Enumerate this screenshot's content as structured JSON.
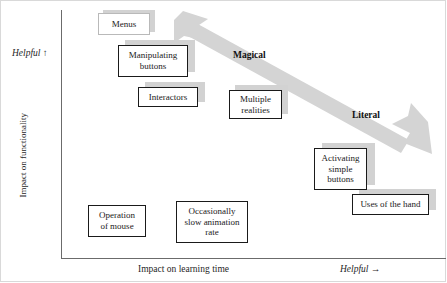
{
  "figure": {
    "type": "scatter-quadrant-diagram",
    "axes": {
      "y_title": "Impact on functionality",
      "y_direction_label": "Helpful ↑",
      "x_title": "Impact on learning time",
      "x_direction_label": "Helpful →"
    },
    "arrow": {
      "name": "magical-literal-double-arrow",
      "color": "#d4d4d4",
      "start_label": "Magical",
      "end_label": "Literal",
      "direction": "bidirectional-diagonal"
    },
    "boxes": [
      {
        "id": "menus",
        "label": "Menus",
        "style": "light",
        "shadow": true
      },
      {
        "id": "manipulating",
        "label": "Manipulating\nbuttons",
        "style": "dark",
        "shadow": true
      },
      {
        "id": "interactors",
        "label": "Interactors",
        "style": "dark",
        "shadow": true
      },
      {
        "id": "multiple",
        "label": "Multiple\nrealities",
        "style": "dark",
        "shadow": true
      },
      {
        "id": "activating",
        "label": "Activating\nsimple\nbuttons",
        "style": "dark",
        "shadow": true
      },
      {
        "id": "uses-hand",
        "label": "Uses of the hand",
        "style": "dark",
        "shadow": true
      },
      {
        "id": "operation",
        "label": "Operation\nof mouse",
        "style": "dark",
        "shadow": false
      },
      {
        "id": "occasionally",
        "label": "Occasionally\nslow animation\nrate",
        "style": "dark",
        "shadow": false
      }
    ],
    "chart_data": {
      "type": "scatter",
      "title": "",
      "xlabel": "Impact on learning time",
      "ylabel": "Impact on functionality",
      "annotations": [
        "Magical",
        "Literal"
      ],
      "categories": [
        "Menus",
        "Manipulating buttons",
        "Interactors",
        "Multiple realities",
        "Activating simple buttons",
        "Uses of the hand",
        "Operation of mouse",
        "Occasionally slow animation rate"
      ]
    }
  }
}
